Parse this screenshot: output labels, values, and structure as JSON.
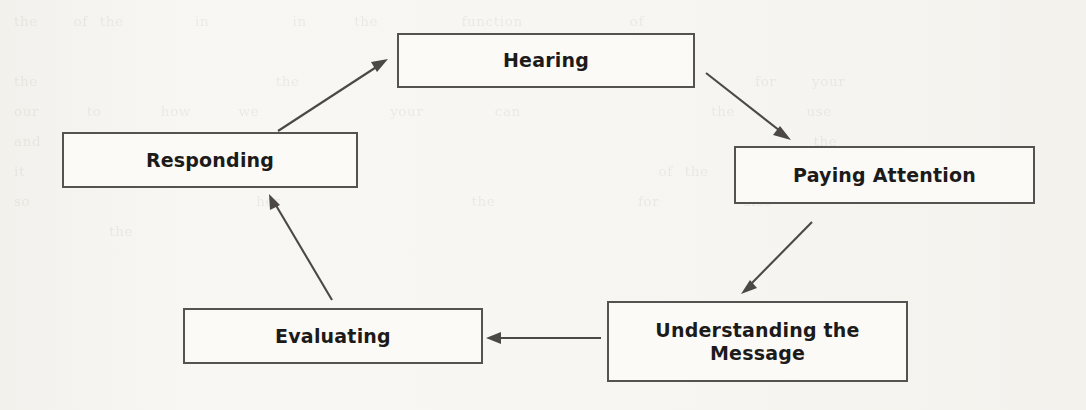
{
  "page": {
    "background_color": "#f6f5f1",
    "ghost_text": "the   of the      in       in    the       function         of\n                                        by\nthe                    the          the             and           for   your\nour    to     how    we           your      can                the      use\nand    the       it      the                                           the\nit       and                                            of the\nso                   her                the            for       also\n        the"
  },
  "diagram": {
    "type": "cycle-flowchart",
    "node_border_color": "#565252",
    "node_fill_color": "#fbfaf7",
    "arrow_color": "#4c4846",
    "text_color": "#1d1b1a",
    "nodes": [
      {
        "id": "hearing",
        "label": "Hearing",
        "x": 397,
        "y": 33,
        "w": 298,
        "h": 55
      },
      {
        "id": "paying-attention",
        "label": "Paying Attention",
        "x": 734,
        "y": 146,
        "w": 301,
        "h": 58
      },
      {
        "id": "understanding",
        "label": "Understanding the\nMessage",
        "x": 607,
        "y": 301,
        "w": 301,
        "h": 81
      },
      {
        "id": "evaluating",
        "label": "Evaluating",
        "x": 183,
        "y": 308,
        "w": 300,
        "h": 56
      },
      {
        "id": "responding",
        "label": "Responding",
        "x": 62,
        "y": 132,
        "w": 296,
        "h": 56
      }
    ],
    "edges": [
      {
        "id": "hearing-to-paying-attention",
        "from": "hearing",
        "to": "paying-attention",
        "direction": "down-right"
      },
      {
        "id": "paying-attention-to-understanding",
        "from": "paying-attention",
        "to": "understanding",
        "direction": "down-left"
      },
      {
        "id": "understanding-to-evaluating",
        "from": "understanding",
        "to": "evaluating",
        "direction": "left"
      },
      {
        "id": "evaluating-to-responding",
        "from": "evaluating",
        "to": "responding",
        "direction": "up-left"
      },
      {
        "id": "responding-to-hearing",
        "from": "responding",
        "to": "hearing",
        "direction": "up-right"
      }
    ]
  }
}
